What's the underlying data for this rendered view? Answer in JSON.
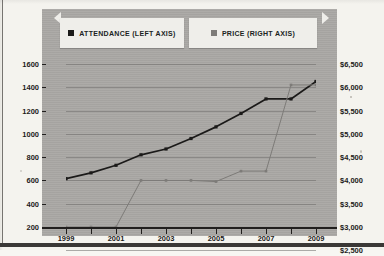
{
  "legend": {
    "items": [
      {
        "label": "ATTENDANCE (LEFT AXIS)",
        "marker": "filled-square-marker",
        "color": "#1b1a19"
      },
      {
        "label": "PRICE (RIGHT AXIS)",
        "marker": "filled-square-marker",
        "color": "#7d7b78"
      }
    ]
  },
  "axes": {
    "left_ticks": [
      "1600",
      "1400",
      "1200",
      "1000",
      "800",
      "600",
      "400",
      "200"
    ],
    "right_ticks": [
      "$6,500",
      "$6,000",
      "$5,500",
      "$5,000",
      "$4,500",
      "$4,000",
      "$3,500",
      "$3,000",
      "$2,500",
      "$2,000",
      "$1,000"
    ],
    "x_ticks": [
      "1999",
      "2001",
      "2003",
      "2005",
      "2007",
      "2009"
    ]
  },
  "chart_data": {
    "type": "line",
    "title": "",
    "xlabel": "",
    "ylabel": "",
    "x": [
      1999,
      2000,
      2001,
      2002,
      2003,
      2004,
      2005,
      2006,
      2007,
      2008,
      2009
    ],
    "series": [
      {
        "name": "ATTENDANCE (LEFT AXIS)",
        "axis": "left",
        "color": "#1b1a19",
        "marker": "square",
        "values": [
          615,
          665,
          730,
          820,
          870,
          960,
          1060,
          1175,
          1300,
          1300,
          1450
        ]
      },
      {
        "name": "PRICE (RIGHT AXIS)",
        "axis": "right",
        "color": "#7d7b78",
        "marker": "square",
        "values": [
          3000,
          3000,
          3000,
          4000,
          4000,
          4000,
          3975,
          4200,
          4200,
          6050,
          6050
        ]
      }
    ],
    "ylim_left": [
      200,
      1600
    ],
    "ylim_right": [
      1500,
      6500
    ],
    "ytick_step_left": 200,
    "ytick_step_right": 500,
    "xlim": [
      1999,
      2009
    ],
    "grid": true,
    "legend_position": "top"
  }
}
